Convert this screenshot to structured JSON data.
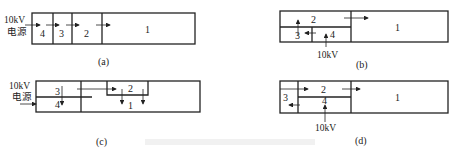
{
  "diagram": {
    "panels": [
      {
        "id": "a",
        "caption": "(a)",
        "source_label_line1": "10kV",
        "source_label_line2": "电源",
        "rooms": [
          "4",
          "3",
          "2",
          "1"
        ]
      },
      {
        "id": "b",
        "caption": "(b)",
        "source_label": "10kV",
        "rooms": [
          "2",
          "3",
          "4",
          "1"
        ]
      },
      {
        "id": "c",
        "caption": "(c)",
        "source_label_line1": "10kV",
        "source_label_line2": "电源",
        "rooms": [
          "3",
          "4",
          "2",
          "1"
        ]
      },
      {
        "id": "d",
        "caption": "(d)",
        "source_label": "10kV",
        "rooms": [
          "2",
          "3",
          "4",
          "1"
        ]
      }
    ],
    "colors": {
      "line": "#222222",
      "background": "#ffffff"
    }
  }
}
